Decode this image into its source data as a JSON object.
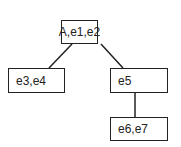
{
  "diagram": {
    "type": "tree",
    "nodes": [
      {
        "id": "root",
        "label": "A,e1,e2"
      },
      {
        "id": "left",
        "label": "e3,e4"
      },
      {
        "id": "right",
        "label": "e5"
      },
      {
        "id": "right-child",
        "label": "e6,e7"
      }
    ],
    "edges": [
      {
        "from": "root",
        "to": "left"
      },
      {
        "from": "root",
        "to": "right"
      },
      {
        "from": "right",
        "to": "right-child"
      }
    ]
  }
}
